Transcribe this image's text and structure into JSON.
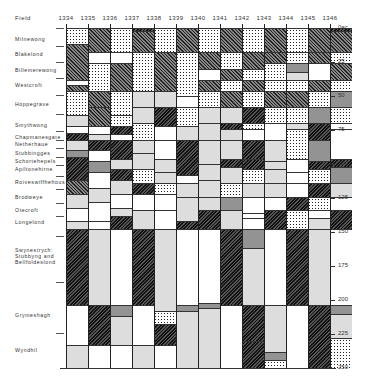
{
  "header": {
    "field_label": "Field"
  },
  "chart_data": {
    "type": "table",
    "title": "",
    "xlabel": "Year",
    "ylabel": "Acres",
    "ylim": [
      0,
      250
    ],
    "years": [
      "1334",
      "1335",
      "1336",
      "1337",
      "1338",
      "1339",
      "1340",
      "1341",
      "1342",
      "1343",
      "1344",
      "1345",
      "1346"
    ],
    "y_ticks": [
      {
        "value": 0,
        "label": "0ac."
      },
      {
        "value": 25,
        "label": "25"
      },
      {
        "value": 50,
        "label": "50"
      },
      {
        "value": 75,
        "label": "75"
      },
      {
        "value": 100,
        "label": "100"
      },
      {
        "value": 125,
        "label": "125"
      },
      {
        "value": 150,
        "label": "150"
      },
      {
        "value": 175,
        "label": "175"
      },
      {
        "value": 200,
        "label": "200"
      },
      {
        "value": 225,
        "label": "225"
      },
      {
        "value": 250,
        "label": "250"
      }
    ],
    "fields": [
      {
        "name": "Milnewong",
        "y": 8
      },
      {
        "name": "Blakelond",
        "y": 19
      },
      {
        "name": "Billemerewong",
        "y": 31
      },
      {
        "name": "Westcroft",
        "y": 42
      },
      {
        "name": "Hoppegrave",
        "y": 56
      },
      {
        "name": "Smythwong",
        "y": 71
      },
      {
        "name": "Chapmanesgate",
        "y": 80
      },
      {
        "name": "Netherhaue",
        "y": 85
      },
      {
        "name": "Stubbingges",
        "y": 92
      },
      {
        "name": "Schortehepels",
        "y": 98
      },
      {
        "name": "Apiltonehirne",
        "y": 104
      },
      {
        "name": "Roiveswiffhehous",
        "y": 113
      },
      {
        "name": "Brodweye",
        "y": 124
      },
      {
        "name": "Otecroft",
        "y": 134
      },
      {
        "name": "Longelond",
        "y": 143
      },
      {
        "name": "Swynestrych: Stubbyng and Bellfoldeslond",
        "y": 163
      },
      {
        "name": "Grymeshagh",
        "y": 211
      },
      {
        "name": "Wyndhil",
        "y": 237
      }
    ],
    "legend_patterns": [
      "dots",
      "hatch",
      "dark",
      "grey",
      "mid",
      "white"
    ],
    "columns": [
      [
        [
          0,
          12,
          "dots"
        ],
        [
          12,
          38,
          "hatch"
        ],
        [
          38,
          42,
          "white"
        ],
        [
          42,
          46,
          "hatch"
        ],
        [
          46,
          64,
          "dots"
        ],
        [
          64,
          72,
          "grey"
        ],
        [
          72,
          77,
          "white"
        ],
        [
          77,
          82,
          "dark"
        ],
        [
          82,
          90,
          "grey"
        ],
        [
          90,
          95,
          "mid"
        ],
        [
          95,
          112,
          "dark"
        ],
        [
          112,
          122,
          "hatch"
        ],
        [
          122,
          132,
          "grey"
        ],
        [
          132,
          142,
          "white"
        ],
        [
          142,
          148,
          "grey"
        ],
        [
          148,
          204,
          "dark"
        ],
        [
          204,
          233,
          "white"
        ],
        [
          233,
          250,
          "grey"
        ]
      ],
      [
        [
          0,
          18,
          "hatch"
        ],
        [
          18,
          26,
          "white"
        ],
        [
          26,
          46,
          "dots"
        ],
        [
          46,
          58,
          "hatch"
        ],
        [
          58,
          72,
          "hatch"
        ],
        [
          72,
          78,
          "white"
        ],
        [
          78,
          82,
          "grey"
        ],
        [
          82,
          90,
          "dark"
        ],
        [
          90,
          98,
          "white"
        ],
        [
          98,
          106,
          "mid"
        ],
        [
          106,
          118,
          "white"
        ],
        [
          118,
          128,
          "grey"
        ],
        [
          128,
          142,
          "white"
        ],
        [
          142,
          148,
          "white"
        ],
        [
          148,
          204,
          "grey"
        ],
        [
          204,
          233,
          "dark"
        ],
        [
          233,
          250,
          "white"
        ]
      ],
      [
        [
          0,
          18,
          "dots"
        ],
        [
          18,
          26,
          "white"
        ],
        [
          26,
          46,
          "hatch"
        ],
        [
          46,
          64,
          "dots"
        ],
        [
          64,
          72,
          "dots"
        ],
        [
          72,
          78,
          "dark"
        ],
        [
          78,
          82,
          "white"
        ],
        [
          82,
          96,
          "dark"
        ],
        [
          96,
          104,
          "grey"
        ],
        [
          104,
          112,
          "dark"
        ],
        [
          112,
          122,
          "grey"
        ],
        [
          122,
          132,
          "white"
        ],
        [
          132,
          138,
          "grey"
        ],
        [
          138,
          148,
          "dark"
        ],
        [
          148,
          204,
          "white"
        ],
        [
          204,
          212,
          "mid"
        ],
        [
          212,
          233,
          "grey"
        ],
        [
          233,
          250,
          "white"
        ]
      ],
      [
        [
          0,
          2,
          "dark"
        ],
        [
          2,
          18,
          "hatch"
        ],
        [
          18,
          46,
          "dots"
        ],
        [
          46,
          58,
          "grey"
        ],
        [
          58,
          70,
          "grey"
        ],
        [
          70,
          82,
          "dots"
        ],
        [
          82,
          92,
          "grey"
        ],
        [
          92,
          104,
          "grey"
        ],
        [
          104,
          114,
          "dots"
        ],
        [
          114,
          122,
          "dark"
        ],
        [
          122,
          134,
          "white"
        ],
        [
          134,
          148,
          "grey"
        ],
        [
          148,
          204,
          "dark"
        ],
        [
          204,
          233,
          "white"
        ],
        [
          233,
          250,
          "grey"
        ]
      ],
      [
        [
          0,
          18,
          "dots"
        ],
        [
          18,
          46,
          "hatch"
        ],
        [
          46,
          58,
          "grey"
        ],
        [
          58,
          72,
          "dark"
        ],
        [
          72,
          82,
          "white"
        ],
        [
          82,
          96,
          "white"
        ],
        [
          96,
          106,
          "grey"
        ],
        [
          106,
          114,
          "grey"
        ],
        [
          114,
          122,
          "dots"
        ],
        [
          122,
          134,
          "white"
        ],
        [
          134,
          148,
          "white"
        ],
        [
          148,
          208,
          "grey"
        ],
        [
          208,
          218,
          "dots"
        ],
        [
          218,
          233,
          "dark"
        ],
        [
          233,
          250,
          "white"
        ]
      ],
      [
        [
          0,
          18,
          "hatch"
        ],
        [
          18,
          50,
          "dots"
        ],
        [
          50,
          58,
          "white"
        ],
        [
          58,
          72,
          "dots"
        ],
        [
          72,
          82,
          "grey"
        ],
        [
          82,
          108,
          "dark"
        ],
        [
          108,
          114,
          "white"
        ],
        [
          114,
          124,
          "grey"
        ],
        [
          124,
          142,
          "grey"
        ],
        [
          142,
          148,
          "dark"
        ],
        [
          148,
          204,
          "white"
        ],
        [
          204,
          208,
          "mid"
        ],
        [
          208,
          250,
          "grey"
        ]
      ],
      [
        [
          0,
          18,
          "dots"
        ],
        [
          18,
          30,
          "hatch"
        ],
        [
          30,
          38,
          "white"
        ],
        [
          38,
          46,
          "hatch"
        ],
        [
          46,
          58,
          "dots"
        ],
        [
          58,
          70,
          "grey"
        ],
        [
          70,
          82,
          "grey"
        ],
        [
          82,
          100,
          "grey"
        ],
        [
          100,
          112,
          "grey"
        ],
        [
          112,
          124,
          "grey"
        ],
        [
          124,
          134,
          "grey"
        ],
        [
          134,
          148,
          "dark"
        ],
        [
          148,
          202,
          "white"
        ],
        [
          202,
          206,
          "mid"
        ],
        [
          206,
          250,
          "grey"
        ]
      ],
      [
        [
          0,
          18,
          "hatch"
        ],
        [
          18,
          30,
          "dots"
        ],
        [
          30,
          38,
          "hatch"
        ],
        [
          38,
          46,
          "dots"
        ],
        [
          46,
          58,
          "hatch"
        ],
        [
          58,
          70,
          "grey"
        ],
        [
          70,
          74,
          "dark"
        ],
        [
          74,
          82,
          "grey"
        ],
        [
          82,
          96,
          "grey"
        ],
        [
          96,
          102,
          "dark"
        ],
        [
          102,
          114,
          "grey"
        ],
        [
          114,
          124,
          "dots"
        ],
        [
          124,
          134,
          "mid"
        ],
        [
          134,
          148,
          "grey"
        ],
        [
          148,
          204,
          "dark"
        ],
        [
          204,
          250,
          "white"
        ]
      ],
      [
        [
          0,
          18,
          "dots"
        ],
        [
          18,
          30,
          "hatch"
        ],
        [
          30,
          38,
          "dots"
        ],
        [
          38,
          46,
          "hatch"
        ],
        [
          46,
          58,
          "dots"
        ],
        [
          58,
          70,
          "dark"
        ],
        [
          70,
          74,
          "dots"
        ],
        [
          74,
          82,
          "white"
        ],
        [
          82,
          96,
          "dark"
        ],
        [
          96,
          104,
          "dark"
        ],
        [
          104,
          114,
          "dots"
        ],
        [
          114,
          124,
          "grey"
        ],
        [
          124,
          136,
          "white"
        ],
        [
          136,
          140,
          "white"
        ],
        [
          140,
          148,
          "white"
        ],
        [
          148,
          162,
          "mid"
        ],
        [
          162,
          204,
          "grey"
        ],
        [
          204,
          230,
          "dark"
        ],
        [
          230,
          250,
          "dark"
        ]
      ],
      [
        [
          0,
          18,
          "hatch"
        ],
        [
          18,
          26,
          "hatch"
        ],
        [
          26,
          38,
          "dots"
        ],
        [
          38,
          46,
          "dots"
        ],
        [
          46,
          58,
          "hatch"
        ],
        [
          58,
          70,
          "dots"
        ],
        [
          70,
          82,
          "white"
        ],
        [
          82,
          98,
          "grey"
        ],
        [
          98,
          104,
          "grey"
        ],
        [
          104,
          114,
          "grey"
        ],
        [
          114,
          124,
          "grey"
        ],
        [
          124,
          134,
          "white"
        ],
        [
          134,
          148,
          "dark"
        ],
        [
          148,
          204,
          "white"
        ],
        [
          204,
          238,
          "grey"
        ],
        [
          238,
          244,
          "mid"
        ],
        [
          244,
          250,
          "dots"
        ]
      ],
      [
        [
          0,
          18,
          "dots"
        ],
        [
          18,
          26,
          "dots"
        ],
        [
          26,
          32,
          "mid"
        ],
        [
          32,
          38,
          "grey"
        ],
        [
          38,
          46,
          "dots"
        ],
        [
          46,
          58,
          "hatch"
        ],
        [
          58,
          70,
          "dots"
        ],
        [
          70,
          74,
          "grey"
        ],
        [
          74,
          96,
          "dots"
        ],
        [
          96,
          106,
          "white"
        ],
        [
          106,
          114,
          "white"
        ],
        [
          114,
          124,
          "white"
        ],
        [
          124,
          134,
          "dark"
        ],
        [
          134,
          148,
          "dots"
        ],
        [
          148,
          204,
          "dark"
        ],
        [
          204,
          250,
          "white"
        ]
      ],
      [
        [
          0,
          18,
          "hatch"
        ],
        [
          18,
          26,
          "hatch"
        ],
        [
          26,
          38,
          "white"
        ],
        [
          38,
          46,
          "hatch"
        ],
        [
          46,
          58,
          "dots"
        ],
        [
          58,
          70,
          "mid"
        ],
        [
          70,
          82,
          "dark"
        ],
        [
          82,
          98,
          "mid"
        ],
        [
          98,
          104,
          "dark"
        ],
        [
          104,
          114,
          "dots"
        ],
        [
          114,
          124,
          "dark"
        ],
        [
          124,
          134,
          "dots"
        ],
        [
          134,
          140,
          "white"
        ],
        [
          140,
          148,
          "grey"
        ],
        [
          148,
          204,
          "grey"
        ],
        [
          204,
          250,
          "dark"
        ]
      ],
      [
        [
          0,
          2,
          "dark"
        ],
        [
          2,
          18,
          "hatch"
        ],
        [
          18,
          26,
          "dots"
        ],
        [
          26,
          38,
          "hatch"
        ],
        [
          38,
          46,
          "dots"
        ],
        [
          46,
          58,
          "mid"
        ],
        [
          58,
          70,
          "dots"
        ],
        [
          70,
          74,
          "white"
        ],
        [
          74,
          96,
          "white"
        ],
        [
          96,
          102,
          "dark"
        ],
        [
          102,
          114,
          "mid"
        ],
        [
          114,
          124,
          "grey"
        ],
        [
          124,
          134,
          "white"
        ],
        [
          134,
          148,
          "dark"
        ],
        [
          148,
          204,
          "white"
        ],
        [
          204,
          210,
          "mid"
        ],
        [
          210,
          228,
          "grey"
        ],
        [
          228,
          250,
          "dots"
        ]
      ]
    ]
  }
}
